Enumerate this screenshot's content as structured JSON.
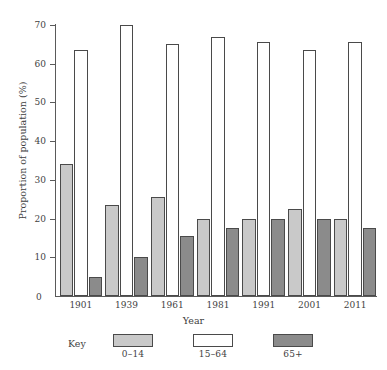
{
  "chart_data": {
    "type": "bar",
    "title": "",
    "subtitle": "",
    "xlabel": "Year",
    "ylabel": "Proportion of population (%)",
    "categories": [
      "1901",
      "1939",
      "1961",
      "1981",
      "1991",
      "2001",
      "2011"
    ],
    "series": [
      {
        "name": "0–14",
        "values": [
          34,
          23.5,
          25.5,
          20,
          20,
          22.5,
          20
        ]
      },
      {
        "name": "15–64",
        "values": [
          63.5,
          70,
          65,
          67,
          65.5,
          63.5,
          65.5
        ]
      },
      {
        "name": "65+",
        "values": [
          5,
          10,
          15.5,
          17.5,
          20,
          20,
          17.5
        ]
      }
    ],
    "ylim": [
      0,
      70
    ],
    "yticks": [
      0,
      10,
      20,
      30,
      40,
      50,
      60,
      70
    ],
    "ytick_labels": [
      "0",
      "10",
      "20",
      "30",
      "40",
      "50",
      "60",
      "70"
    ],
    "grid": false,
    "legend_position": "bottom",
    "legend_title": "Key",
    "colors": {
      "series_0_14": "#c9c9c9",
      "series_15_64": "#ffffff",
      "series_65_plus": "#8b8b8b",
      "bar_outline": "#4a4a4a",
      "axis": "#5a5a5a",
      "text": "#3f3f3f",
      "background": "#ffffff"
    }
  }
}
